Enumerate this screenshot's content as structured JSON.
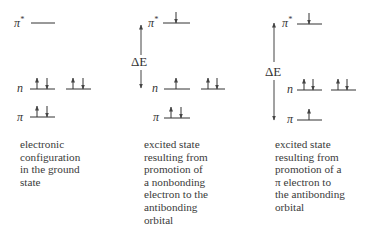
{
  "diagram": {
    "levels": {
      "pi_star": "π",
      "pi_star_sup": "*",
      "n": "n",
      "pi": "π"
    },
    "delta_e_label": "ΔE",
    "panels": [
      {
        "id": "ground-state",
        "occupancy": {
          "pi_star": "empty",
          "n1": "paired",
          "n2": "paired",
          "pi": "paired"
        },
        "caption_lines": [
          "electronic",
          "configuration",
          "in the ground",
          "state"
        ]
      },
      {
        "id": "n-to-pi-star",
        "occupancy": {
          "pi_star": "down",
          "n1": "up",
          "n2": "paired",
          "pi": "paired"
        },
        "caption_lines": [
          "excited state",
          "resulting from",
          "promotion of",
          "a nonbonding",
          "electron to the",
          "antibonding",
          "orbital"
        ]
      },
      {
        "id": "pi-to-pi-star",
        "occupancy": {
          "pi_star": "down",
          "n1": "paired",
          "n2": "paired",
          "pi": "up"
        },
        "caption_lines": [
          "excited state",
          "resulting from",
          "promotion of a",
          "π electron to",
          "the antibonding",
          "orbital"
        ]
      }
    ]
  }
}
